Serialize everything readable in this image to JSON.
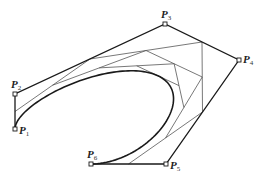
{
  "diagram": {
    "type": "bezier-de-casteljau",
    "colors": {
      "polygon": "#1a1a1a",
      "curve": "#1a1a1a",
      "construction": "#555555",
      "background": "#ffffff"
    },
    "control_points": [
      {
        "name": "P",
        "sub": "1",
        "x": 15,
        "y": 129,
        "lx": 19,
        "ly": 134
      },
      {
        "name": "P",
        "sub": "2",
        "x": 15,
        "y": 94,
        "lx": 11,
        "ly": 88
      },
      {
        "name": "P",
        "sub": "3",
        "x": 165,
        "y": 24,
        "lx": 161,
        "ly": 18
      },
      {
        "name": "P",
        "sub": "4",
        "x": 239,
        "y": 60,
        "lx": 243,
        "ly": 63
      },
      {
        "name": "P",
        "sub": "5",
        "x": 166,
        "y": 164,
        "lx": 170,
        "ly": 169
      },
      {
        "name": "P",
        "sub": "6",
        "x": 91,
        "y": 164,
        "lx": 87,
        "ly": 158
      }
    ],
    "t": 0.5
  }
}
